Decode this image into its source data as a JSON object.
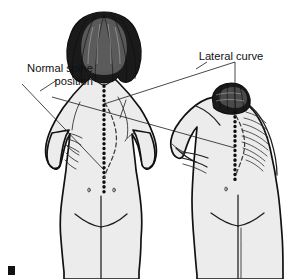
{
  "illustration": {
    "title": "Scoliosis examination: normal spine position versus lateral curve",
    "subject": "scoliosis-back-view-comparison",
    "background_color": "#ffffff",
    "body_fill_color": "#ececec",
    "outline_color": "#111111",
    "hair_color": "#1a1a1a",
    "marker_color": "#111111"
  },
  "labels": {
    "normal_spine": {
      "line1": "Normal spine",
      "line2": "position",
      "alignment": "right",
      "position": "upper-left"
    },
    "lateral_curve": {
      "text": "Lateral curve",
      "alignment": "center",
      "position": "upper-right"
    }
  },
  "figures": {
    "left": {
      "name": "standing-figure",
      "description": "Standing female figure viewed from behind, hands on hips",
      "spine_marks": [
        "normal-spine-dotted-line",
        "curved-spine-dashed-line"
      ]
    },
    "right": {
      "name": "bending-figure",
      "description": "Female figure bending forward viewed from behind, showing rib hump",
      "spine_marks": [
        "normal-spine-dotted-line",
        "curved-spine-dashed-line"
      ],
      "features": [
        "rib-hump-hatching"
      ]
    }
  },
  "annotations": {
    "leader_lines": [
      "normal-spine-leader",
      "lateral-curve-leader-vertical",
      "lateral-curve-leader-diagonal"
    ]
  }
}
